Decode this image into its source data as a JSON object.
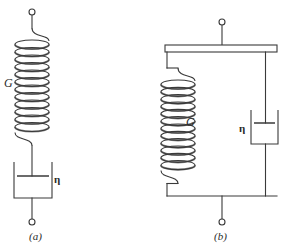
{
  "figure": {
    "background_color": "#ffffff",
    "stroke_color": "#3a3a3a",
    "coil_shade_color": "#8a8a8a",
    "width": 299,
    "height": 252
  },
  "panels": [
    {
      "id": "a",
      "caption": "(a)",
      "model_name": "maxwell-model-series",
      "elements": {
        "spring": {
          "label": "G",
          "label_side": "left",
          "coil_count": 12,
          "center_x": 32,
          "top_y": 40,
          "bottom_y": 130,
          "coil_rx": 17,
          "coil_ry": 4.5
        },
        "dashpot": {
          "label": "η",
          "label_side": "right",
          "box_left": 14,
          "box_right": 52,
          "box_top": 162,
          "box_bottom": 198,
          "piston_y": 176
        },
        "terminal_top": {
          "cx": 32,
          "cy": 12,
          "r": 3
        },
        "terminal_bottom": {
          "cx": 32,
          "cy": 222,
          "r": 3
        }
      }
    },
    {
      "id": "b",
      "caption": "(b)",
      "model_name": "kelvin-voigt-model-parallel",
      "elements": {
        "rigid_bar": {
          "left": 165,
          "right": 277,
          "top": 45,
          "bottom": 52
        },
        "spring": {
          "label": "G",
          "label_side": "right",
          "coil_count": 12,
          "center_x": 178,
          "top_y": 80,
          "bottom_y": 168,
          "coil_rx": 17,
          "coil_ry": 4.5
        },
        "dashpot": {
          "label": "η",
          "label_side": "left",
          "box_left": 251,
          "box_right": 278,
          "box_top": 110,
          "box_bottom": 144,
          "piston_y": 123
        },
        "bottom_bar": {
          "left": 167,
          "right": 277,
          "y": 196
        },
        "terminal_top": {
          "cx": 222,
          "cy": 22,
          "r": 3
        },
        "terminal_bottom": {
          "cx": 222,
          "cy": 222,
          "r": 3
        }
      }
    }
  ],
  "labels": {
    "shear_modulus": "G",
    "viscosity": "η",
    "caption_a": "(a)",
    "caption_b": "(b)"
  }
}
